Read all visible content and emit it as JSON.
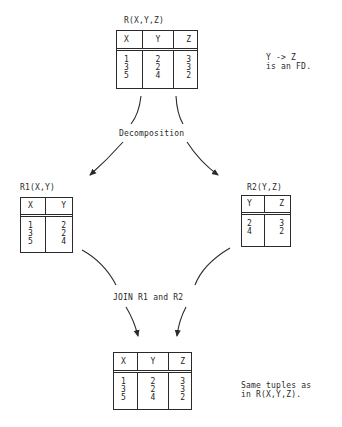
{
  "relations": {
    "r": {
      "label": "R(X,Y,Z)",
      "headers": [
        "X",
        "Y",
        "Z"
      ],
      "columns": [
        [
          "1",
          "3",
          "5"
        ],
        [
          "2",
          "2",
          "4"
        ],
        [
          "3",
          "3",
          "2"
        ]
      ]
    },
    "r1": {
      "label": "R1(X,Y)",
      "headers": [
        "X",
        "Y"
      ],
      "columns": [
        [
          "1",
          "3",
          "5"
        ],
        [
          "2",
          "2",
          "4"
        ]
      ]
    },
    "r2": {
      "label": "R2(Y,Z)",
      "headers": [
        "Y",
        "Z"
      ],
      "columns": [
        [
          "2",
          "4"
        ],
        [
          "3",
          "2"
        ]
      ]
    },
    "joined": {
      "label": "",
      "headers": [
        "X",
        "Y",
        "Z"
      ],
      "columns": [
        [
          "1",
          "3",
          "5"
        ],
        [
          "2",
          "2",
          "4"
        ],
        [
          "3",
          "3",
          "2"
        ]
      ]
    }
  },
  "annotations": {
    "fd_line1": "Y -> Z",
    "fd_line2": "is an FD.",
    "decomposition": "Decomposition",
    "join": "JOIN R1 and R2",
    "same_line1": "Same tuples as",
    "same_line2": "in R(X,Y,Z)."
  },
  "colors": {
    "ink": "#2a2a2a",
    "background": "#ffffff"
  }
}
